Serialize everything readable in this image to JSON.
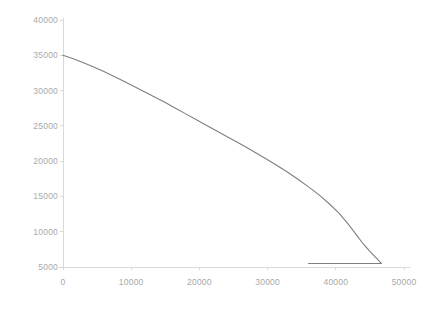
{
  "chart_data": {
    "type": "line",
    "title": "",
    "subtitle": "",
    "xlabel": "",
    "ylabel": "",
    "xlim": [
      0,
      50000
    ],
    "ylim": [
      5000,
      40000
    ],
    "xticks": [
      0,
      10000,
      20000,
      30000,
      40000,
      50000
    ],
    "yticks": [
      5000,
      10000,
      15000,
      20000,
      25000,
      30000,
      35000,
      40000
    ],
    "xtick_labels": [
      "0",
      "10000",
      "20000",
      "30000",
      "40000",
      "50000"
    ],
    "ytick_labels": [
      "5000",
      "10000",
      "15000",
      "20000",
      "25000",
      "30000",
      "35000",
      "40000"
    ],
    "grid": false,
    "legend": null,
    "legend_position": "none",
    "line_color": "#7f7f7f",
    "axis_color": "#d9d9d9",
    "tick_label_color": "#a9a9a9",
    "background_color": "#ffffff",
    "annotations": [],
    "series": [
      {
        "name": "curve",
        "color": "#7f7f7f",
        "marker": "none",
        "line_width": 1.1,
        "points": [
          [
            0,
            35000
          ],
          [
            1500,
            34500
          ],
          [
            3000,
            33950
          ],
          [
            4500,
            33350
          ],
          [
            6000,
            32700
          ],
          [
            7500,
            32000
          ],
          [
            9000,
            31300
          ],
          [
            10500,
            30550
          ],
          [
            12000,
            29800
          ],
          [
            13500,
            29050
          ],
          [
            15000,
            28300
          ],
          [
            16500,
            27500
          ],
          [
            18000,
            26700
          ],
          [
            19500,
            25900
          ],
          [
            21000,
            25100
          ],
          [
            22500,
            24300
          ],
          [
            24000,
            23500
          ],
          [
            25500,
            22700
          ],
          [
            27000,
            21900
          ],
          [
            28500,
            21050
          ],
          [
            30000,
            20200
          ],
          [
            31500,
            19300
          ],
          [
            33000,
            18400
          ],
          [
            34500,
            17400
          ],
          [
            36000,
            16350
          ],
          [
            37500,
            15250
          ],
          [
            39000,
            14000
          ],
          [
            40500,
            12600
          ],
          [
            41800,
            11100
          ],
          [
            43000,
            9600
          ],
          [
            44000,
            8300
          ],
          [
            45000,
            7200
          ],
          [
            45800,
            6400
          ],
          [
            46300,
            5900
          ],
          [
            46600,
            5600
          ],
          [
            46700,
            5500
          ],
          [
            46500,
            5500
          ],
          [
            45000,
            5500
          ],
          [
            43000,
            5500
          ],
          [
            41000,
            5500
          ],
          [
            39000,
            5500
          ],
          [
            37500,
            5500
          ],
          [
            36400,
            5500
          ],
          [
            36000,
            5500
          ]
        ]
      }
    ]
  },
  "axes": {
    "y_axis_name": "y-axis",
    "x_axis_name": "x-axis"
  }
}
